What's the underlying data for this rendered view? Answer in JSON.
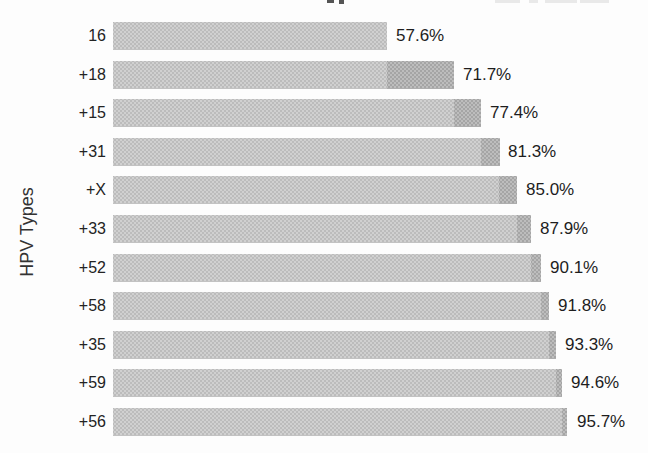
{
  "chart_data": {
    "type": "bar",
    "orientation": "horizontal",
    "title": "",
    "xlabel": "",
    "ylabel": "HPV Types",
    "xlim": [
      0,
      100
    ],
    "grid": false,
    "legend": "none (legend/title cut off at top edge of crop)",
    "categories": [
      "16",
      "+18",
      "+15",
      "+31",
      "+X",
      "+33",
      "+52",
      "+58",
      "+35",
      "+59",
      "+56"
    ],
    "values": [
      57.6,
      71.7,
      77.4,
      81.3,
      85.0,
      87.9,
      90.1,
      91.8,
      93.3,
      94.6,
      95.7
    ],
    "value_labels": [
      "57.6%",
      "71.7%",
      "77.4%",
      "81.3%",
      "85.0%",
      "87.9%",
      "90.1%",
      "91.8%",
      "93.3%",
      "94.6%",
      "95.7%"
    ],
    "increments": [
      57.6,
      14.1,
      5.7,
      3.9,
      3.7,
      2.9,
      2.2,
      1.7,
      1.5,
      1.3,
      1.1
    ],
    "encoding": "cumulative percent; light segment = previous cumulative total, dark tip segment = increment added by this HPV type; first bar is all light",
    "bar_color_light": "#c9c9c9",
    "bar_color_dark": "#b3b3b3",
    "text_color": "#222222",
    "background_color": "#fdfdfd"
  }
}
